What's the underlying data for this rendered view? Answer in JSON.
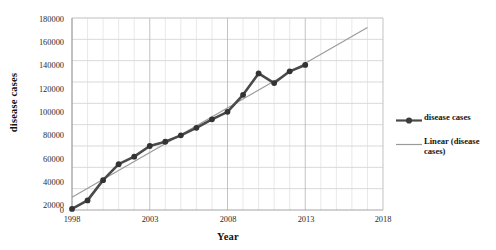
{
  "chart_data": {
    "type": "line",
    "title": "",
    "xlabel": "Year",
    "ylabel": "disease cases",
    "xlim": [
      1998,
      2018
    ],
    "ylim": [
      0,
      180000
    ],
    "xticks": [
      "1998",
      "2003",
      "2008",
      "2013",
      "2018"
    ],
    "yticks": [
      "0",
      "20000",
      "40000",
      "60000",
      "80000",
      "100000",
      "120000",
      "140000",
      "160000",
      "180000"
    ],
    "grid": true,
    "legend_position": "right",
    "x": [
      1998,
      1999,
      2000,
      2001,
      2002,
      2003,
      2004,
      2005,
      2006,
      2007,
      2008,
      2009,
      2010,
      2011,
      2012,
      2013
    ],
    "series": [
      {
        "name": "disease cases",
        "type": "line-markers",
        "color": "#4a4a4a",
        "marker": "circle",
        "values": [
          1000,
          9000,
          28000,
          43000,
          50000,
          60000,
          64000,
          70000,
          77000,
          85000,
          92000,
          108000,
          128000,
          119000,
          130000,
          136000
        ]
      },
      {
        "name": "Linear (disease cases)",
        "type": "trendline",
        "color": "#9a9a9a",
        "x_start": 1998,
        "x_end": 2017,
        "y_start": 12000,
        "y_end": 171000
      }
    ],
    "legend": [
      {
        "label": "disease cases",
        "swatch": "line-marker-swatch",
        "color": "#4a4a4a"
      },
      {
        "label": "Linear (disease cases)",
        "swatch": "thin-line-swatch",
        "color": "#9a9a9a"
      }
    ]
  },
  "axis": {
    "x_title": "Year",
    "y_title": "disease cases"
  }
}
